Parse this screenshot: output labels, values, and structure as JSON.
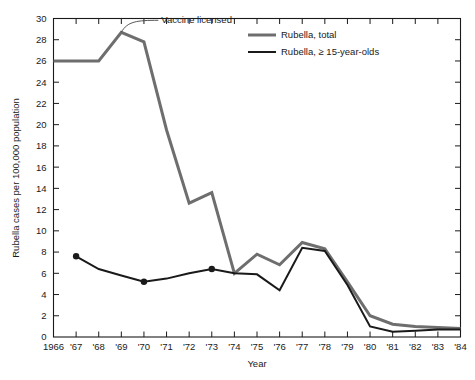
{
  "chart_data": {
    "type": "line",
    "title": "",
    "xlabel": "Year",
    "ylabel": "Rubella cases per 100,000 population",
    "xlim": [
      1966,
      1984
    ],
    "ylim": [
      0,
      30
    ],
    "y_tick_step": 2,
    "grid": false,
    "legend_position": "top-center",
    "x": [
      1966,
      1967,
      1968,
      1969,
      1970,
      1971,
      1972,
      1973,
      1974,
      1975,
      1976,
      1977,
      1978,
      1979,
      1980,
      1981,
      1982,
      1983,
      1984
    ],
    "x_tick_labels": [
      "1966",
      "'67",
      "'68",
      "'69",
      "'70",
      "'71",
      "'72",
      "'73",
      "'74",
      "'75",
      "'76",
      "'77",
      "'78",
      "'79",
      "'80",
      "'81",
      "'82",
      "'83",
      "'84"
    ],
    "y_tick_labels": [
      "0",
      "2",
      "4",
      "6",
      "8",
      "10",
      "12",
      "14",
      "16",
      "18",
      "20",
      "22",
      "24",
      "26",
      "28",
      "30"
    ],
    "series": [
      {
        "name": "Rubella, total",
        "color": "#6e6e6e",
        "width": 3,
        "markers": false,
        "values": [
          26.0,
          26.0,
          26.0,
          28.7,
          27.8,
          19.5,
          12.6,
          13.6,
          6.0,
          7.8,
          6.8,
          8.9,
          8.3,
          5.2,
          2.0,
          1.2,
          1.0,
          0.9,
          0.8
        ]
      },
      {
        "name": "Rubella, ≥ 15-year-olds",
        "color": "#1a1a1a",
        "width": 2,
        "markers": true,
        "marker_years": [
          1967,
          1970,
          1973
        ],
        "values": [
          null,
          7.6,
          6.4,
          5.8,
          5.2,
          5.5,
          6.0,
          6.4,
          6.0,
          5.9,
          4.4,
          8.4,
          8.1,
          4.9,
          1.0,
          0.5,
          0.6,
          0.7,
          0.7
        ]
      }
    ],
    "annotations": [
      {
        "text": "Vaccine licensed",
        "points_to_year": 1969,
        "points_to_value": 28.7
      }
    ]
  },
  "legend": {
    "items": [
      {
        "label": "Rubella, total"
      },
      {
        "label": "Rubella, ≥ 15-year-olds"
      }
    ]
  },
  "axes": {
    "x_title": "Year",
    "y_title": "Rubella cases per 100,000 population"
  }
}
